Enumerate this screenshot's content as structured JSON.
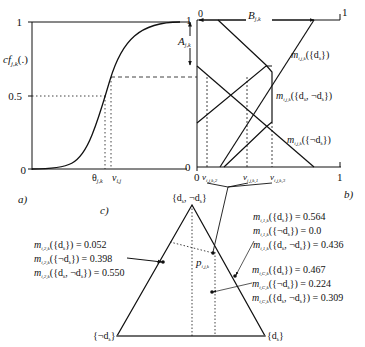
{
  "panels": {
    "a": {
      "label": "a)",
      "y_axis_label": "cf",
      "y_axis_label_sub": "j,k",
      "y_axis_label_suffix": "(.)",
      "y_ticks": [
        "1",
        "0.5",
        "0"
      ],
      "x_ticks": {
        "theta": "θ",
        "theta_sub": "j,k",
        "nu": "ν",
        "nu_sub": "i,j"
      },
      "curve": "sigmoid"
    },
    "b": {
      "label": "b)",
      "x_start": "0",
      "x_end": "1",
      "y_top": "1",
      "y_bottom": "0",
      "top_left": "0",
      "B_label": "B",
      "B_sub": "j,k",
      "A_label": "A",
      "A_sub": "j,k",
      "x_ticks": [
        {
          "sym": "ν",
          "sub": "i,j,k,2"
        },
        {
          "sym": "ν",
          "sub": "i,j,k,1"
        },
        {
          "sym": "ν",
          "sub": "i,j,k,3"
        }
      ],
      "curve_labels": [
        {
          "m_sub": "i,j,k",
          "set": "({d",
          "set_sub": "k",
          "set_end": "})"
        },
        {
          "m_sub": "i,j,k",
          "set": "({d",
          "set_sub": "k",
          "set_mid": ", ¬d",
          "set_sub2": "k",
          "set_end": "})"
        },
        {
          "m_sub": "i,j,k",
          "set": "({¬d",
          "set_sub": "k",
          "set_end": "})"
        }
      ]
    },
    "c": {
      "label": "c)",
      "apex": "{d",
      "apex_sub": "k",
      "apex_mid": ", ¬d",
      "apex_sub2": "k",
      "apex_end": "}",
      "left_vertex": "{¬d",
      "left_vertex_sub": "k",
      "left_vertex_end": "}",
      "right_vertex": "{d",
      "right_vertex_sub": "k",
      "right_vertex_end": "}",
      "point_label": "p",
      "point_label_sub": "i,j,k",
      "groups": [
        {
          "m_sub": "i,2,k",
          "rows": [
            {
              "set": "{d",
              "sub": "k",
              "mid": "",
              "sub2": "",
              "end": "}",
              "value": "0.052"
            },
            {
              "set": "{¬d",
              "sub": "k",
              "mid": "",
              "sub2": "",
              "end": "}",
              "value": "0.398"
            },
            {
              "set": "{d",
              "sub": "k",
              "mid": ", ¬d",
              "sub2": "k",
              "end": "}",
              "value": "0.550"
            }
          ]
        },
        {
          "m_sub": "i,1,k",
          "rows": [
            {
              "set": "{d",
              "sub": "k",
              "mid": "",
              "sub2": "",
              "end": "}",
              "value": "0.564"
            },
            {
              "set": "{¬d",
              "sub": "k",
              "mid": "",
              "sub2": "",
              "end": "}",
              "value": "0.0"
            },
            {
              "set": "{d",
              "sub": "k",
              "mid": ", ¬d",
              "sub2": "k",
              "end": "}",
              "value": "0.436"
            }
          ]
        },
        {
          "m_sub": "i,C,k",
          "rows": [
            {
              "set": "{d",
              "sub": "k",
              "mid": "",
              "sub2": "",
              "end": "}",
              "value": "0.467"
            },
            {
              "set": "{¬d",
              "sub": "k",
              "mid": "",
              "sub2": "",
              "end": "}",
              "value": "0.224"
            },
            {
              "set": "{d",
              "sub": "k",
              "mid": ", ¬d",
              "sub2": "k",
              "end": "}",
              "value": "0.309"
            }
          ]
        }
      ]
    }
  },
  "colors": {
    "ink": "#111111",
    "background": "#ffffff"
  }
}
